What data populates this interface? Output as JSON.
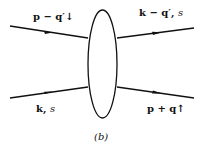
{
  "diagram": {
    "type": "scattering-diagram",
    "caption": "(b)",
    "blob": {
      "shape": "ellipse",
      "cx": 102.5,
      "cy": 64,
      "rx": 14.5,
      "ry": 54
    },
    "lines": [
      {
        "id": "in-top",
        "label": "p − q′↓",
        "from": [
          10,
          26
        ],
        "to": [
          88,
          38
        ],
        "direction": "in"
      },
      {
        "id": "in-bottom",
        "label": "k, s",
        "from": [
          10,
          98
        ],
        "to": [
          88,
          87
        ],
        "direction": "in"
      },
      {
        "id": "out-top",
        "label": "k − q′, s",
        "from": [
          117,
          38
        ],
        "to": [
          194,
          28
        ],
        "direction": "out"
      },
      {
        "id": "out-bottom",
        "label": "p + q↑",
        "from": [
          117,
          87
        ],
        "to": [
          194,
          98
        ],
        "direction": "out"
      }
    ],
    "labels": {
      "in_top_main": "p − q′",
      "in_top_arrow": "↓",
      "out_top_main": "k − q′,",
      "out_top_spin": "s",
      "in_bottom_main": "k,",
      "in_bottom_spin": "s",
      "out_bottom_main": "p + q",
      "out_bottom_arrow": "↑"
    }
  }
}
